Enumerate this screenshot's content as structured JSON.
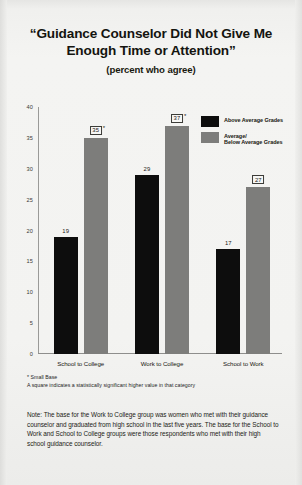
{
  "chart_data": {
    "type": "bar",
    "title": "“Guidance Counselor Did Not Give Me Enough Time or Attention”",
    "title_line1": "“Guidance Counselor Did Not Give Me",
    "title_line2": "Enough Time or Attention”",
    "subtitle": "(percent who agree)",
    "xlabel": "",
    "ylabel": "",
    "ylim": [
      0,
      40
    ],
    "ytick_labels": [
      "40",
      "35",
      "30",
      "25",
      "20",
      "15",
      "10",
      "5",
      "0"
    ],
    "ytick_values": [
      40,
      35,
      30,
      25,
      20,
      15,
      10,
      5,
      0
    ],
    "grid": false,
    "legend_position": "top-right",
    "categories": [
      "School to College",
      "Work to College",
      "School to Work"
    ],
    "series": [
      {
        "name": "Above Average Grades",
        "color": "#0d0d0d",
        "values": [
          19,
          29,
          17
        ],
        "labels": [
          "19",
          "29",
          "17"
        ],
        "boxed": [
          false,
          false,
          false
        ],
        "starred": [
          false,
          false,
          false
        ]
      },
      {
        "name": "Average/Below Average Grades",
        "color": "#7d7d7b",
        "values": [
          35,
          37,
          27
        ],
        "labels": [
          "35",
          "37",
          "27"
        ],
        "boxed": [
          true,
          true,
          true
        ],
        "starred": [
          true,
          true,
          false
        ]
      }
    ],
    "legend_entries": [
      {
        "label": "Above Average Grades",
        "label_line1": "Above Average Grades",
        "label_line2": "",
        "color": "#0d0d0d"
      },
      {
        "label": "Average/Below Average Grades",
        "label_line1": "Average/",
        "label_line2": "Below Average Grades",
        "color": "#7d7d7b"
      }
    ],
    "annotations": [
      "* Small Base",
      "A square indicates a statistically significant higher value in that category"
    ]
  },
  "footnotes": {
    "small_base": "* Small Base",
    "square_meaning": "A square indicates a statistically significant higher value in that category"
  },
  "note": {
    "text": "Note: The base for the Work to College group was women who met with their guidance counselor and graduated from high school in the last five years. The base for the School to Work and School to College groups were those respondents who met with their high school guidance counselor."
  },
  "colors": {
    "above_average": "#0d0d0d",
    "average_below": "#7d7d7b",
    "page_background": "#f3f3f1",
    "text": "#1a1a1a"
  }
}
